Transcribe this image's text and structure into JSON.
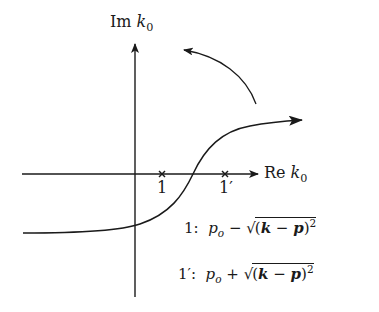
{
  "diagram": {
    "type": "complex-plane contour",
    "axes": {
      "vertical_label": {
        "prefix": "Im ",
        "var": "k",
        "sub": "0"
      },
      "horizontal_label": {
        "prefix": "Re ",
        "var": "k",
        "sub": "0"
      }
    },
    "poles": [
      {
        "id": "1",
        "label": "1",
        "x": 162,
        "y": 174
      },
      {
        "id": "1p",
        "label": "1′",
        "x": 225,
        "y": 174
      }
    ],
    "legend": [
      {
        "key": "1:",
        "p": "p",
        "p_sub": "o",
        "op": "−",
        "sqrt_open": "(",
        "k": "k",
        "minus": "−",
        "pvec": "p",
        "sqrt_close": ")",
        "exp": "2"
      },
      {
        "key": "1′:",
        "p": "p",
        "p_sub": "o",
        "op": "+",
        "sqrt_open": "(",
        "k": "k",
        "minus": "−",
        "pvec": "p",
        "sqrt_close": ")",
        "exp": "2"
      }
    ],
    "colors": {
      "stroke": "#1a1a1a",
      "background": "#ffffff"
    }
  }
}
